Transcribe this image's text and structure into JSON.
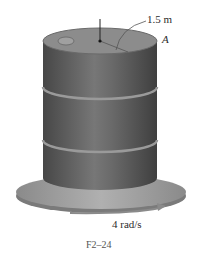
{
  "figure": {
    "caption": "F2–24",
    "labels": {
      "radius": "1.5 m",
      "point": "A",
      "angular_velocity": "4 rad/s"
    },
    "colors": {
      "drum_body": "#5a5a5a",
      "drum_highlight": "#7a7a7a",
      "drum_top": "#8c8c8c",
      "platform": "#9a9a9a",
      "arrow": "#8a8a8a",
      "text": "#2b2b2b"
    }
  }
}
